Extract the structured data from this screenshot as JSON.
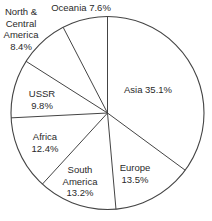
{
  "chart_data": {
    "type": "pie",
    "title": "",
    "start_angle_deg": 0,
    "direction": "clockwise",
    "slices": [
      {
        "name": "Asia",
        "value": 35.1,
        "label": "Asia  35.1%"
      },
      {
        "name": "Europe",
        "value": 13.5,
        "label": "Europe 13.5%"
      },
      {
        "name": "South America",
        "value": 13.2,
        "label": "South America 13.2%"
      },
      {
        "name": "Africa",
        "value": 12.4,
        "label": "Africa 12.4%"
      },
      {
        "name": "USSR",
        "value": 9.8,
        "label": "USSR 9.8%"
      },
      {
        "name": "North & Central America",
        "value": 8.4,
        "label": "North & Central America 8.4%"
      },
      {
        "name": "Oceania",
        "value": 7.6,
        "label": "Oceania  7.6%"
      }
    ],
    "categories": [
      "Asia",
      "Europe",
      "South America",
      "Africa",
      "USSR",
      "North & Central America",
      "Oceania"
    ],
    "values": [
      35.1,
      13.5,
      13.2,
      12.4,
      9.8,
      8.4,
      7.6
    ],
    "unit": "%",
    "fill_color": "#ffffff",
    "line_color": "#444444",
    "legend": "none (labels placed on/near slices)"
  },
  "labels": {
    "oceania": {
      "line1": "Oceania  7.6%"
    },
    "nca": {
      "line1": "North &",
      "line2": "Central",
      "line3": "America",
      "line4": "8.4%"
    },
    "ussr": {
      "line1": "USSR",
      "line2": "9.8%"
    },
    "africa": {
      "line1": "Africa",
      "line2": "12.4%"
    },
    "south_america": {
      "line1": "South",
      "line2": "America",
      "line3": "13.2%"
    },
    "europe": {
      "line1": "Europe",
      "line2": "13.5%"
    },
    "asia": {
      "line1": "Asia  35.1%"
    }
  }
}
